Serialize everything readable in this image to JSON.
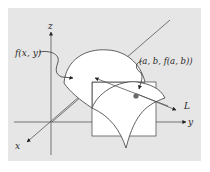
{
  "diagram": {
    "type": "3d-surface-tangent-line",
    "colors": {
      "panel": "#e6e6e6",
      "surface": "#ffffff",
      "stroke": "#3a3a3a",
      "axis": "#555555",
      "point": "#6a6a6a"
    },
    "labels": {
      "z_axis": "z",
      "x_axis": "x",
      "y_axis": "y",
      "surface": "f(x, y)",
      "point": "(a, b, f(a, b))",
      "tangent_line": "L"
    }
  }
}
